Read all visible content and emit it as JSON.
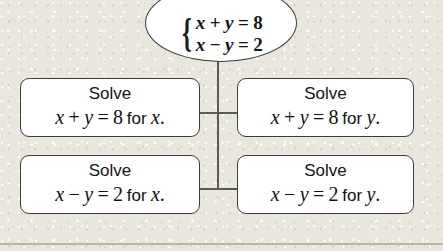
{
  "diagram": {
    "system_node": {
      "brace": "{",
      "equations": [
        {
          "lhs_var1": "x",
          "op": "+",
          "lhs_var2": "y",
          "eq": "=",
          "rhs": "8",
          "full": "x + y = 8"
        },
        {
          "lhs_var1": "x",
          "op": "−",
          "lhs_var2": "y",
          "eq": "=",
          "rhs": "2",
          "full": "x − y = 2"
        }
      ]
    },
    "options": [
      {
        "id": "top-left",
        "title": "Solve",
        "equation": "x + y = 8",
        "var1": "x",
        "op": "+",
        "var2": "y",
        "eq_sign": "=",
        "rhs": "8",
        "for_word": "for",
        "solve_for": "x",
        "period": ".",
        "full": "Solve x + y = 8 for x."
      },
      {
        "id": "top-right",
        "title": "Solve",
        "equation": "x + y = 8",
        "var1": "x",
        "op": "+",
        "var2": "y",
        "eq_sign": "=",
        "rhs": "8",
        "for_word": "for",
        "solve_for": "y",
        "period": ".",
        "full": "Solve x + y = 8 for y."
      },
      {
        "id": "bottom-left",
        "title": "Solve",
        "equation": "x − y = 2",
        "var1": "x",
        "op": "−",
        "var2": "y",
        "eq_sign": "=",
        "rhs": "2",
        "for_word": "for",
        "solve_for": "x",
        "period": ".",
        "full": "Solve x − y = 2 for x."
      },
      {
        "id": "bottom-right",
        "title": "Solve",
        "equation": "x − y = 2",
        "var1": "x",
        "op": "−",
        "var2": "y",
        "eq_sign": "=",
        "rhs": "2",
        "for_word": "for",
        "solve_for": "y",
        "period": ".",
        "full": "Solve x − y = 2 for y."
      }
    ],
    "colors": {
      "background": "#e9e7dd",
      "node_fill": "#ffffff",
      "node_border": "#3b3d38",
      "connector": "#595c52",
      "text": "#141414",
      "rule": "#b9b6a8"
    }
  }
}
